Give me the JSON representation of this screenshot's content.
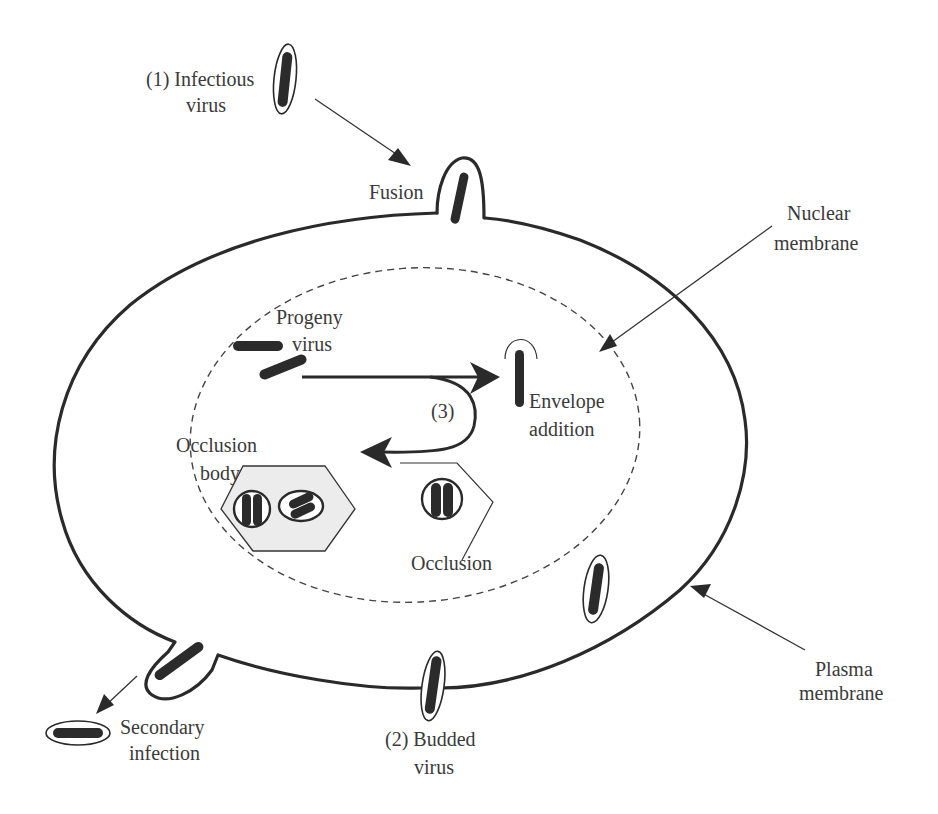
{
  "diagram": {
    "labels": {
      "infectious_virus_line1": "(1) Infectious",
      "infectious_virus_line2": "virus",
      "fusion": "Fusion",
      "nuclear_membrane_line1": "Nuclear",
      "nuclear_membrane_line2": "membrane",
      "progeny_virus_line1": "Progeny",
      "progeny_virus_line2": "virus",
      "step3": "(3)",
      "envelope_addition_line1": "Envelope",
      "envelope_addition_line2": "addition",
      "occlusion_body_line1": "Occlusion",
      "occlusion_body_line2": "body",
      "occlusion": "Occlusion",
      "plasma_membrane_line1": "Plasma",
      "plasma_membrane_line2": "membrane",
      "secondary_infection_line1": "Secondary",
      "secondary_infection_line2": "infection",
      "budded_virus_line1": "(2) Budded",
      "budded_virus_line2": "virus"
    },
    "colors": {
      "line": "#2a2a2a",
      "text": "#3a3a3a",
      "occlusion_body_fill": "#ececec",
      "background": "#ffffff"
    }
  }
}
